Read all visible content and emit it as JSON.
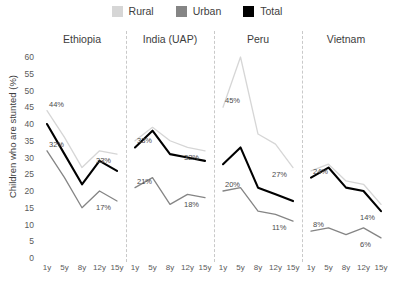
{
  "chart_data": {
    "type": "line",
    "title": "",
    "xlabel": "",
    "ylabel": "Children who are stunted (%)",
    "ylim": [
      0,
      60
    ],
    "yticks": [
      0,
      5,
      10,
      15,
      20,
      25,
      30,
      35,
      40,
      45,
      50,
      55,
      60
    ],
    "grid": false,
    "legend_position": "top-center",
    "legend": [
      {
        "name": "Rural",
        "color": "#d6d6d6"
      },
      {
        "name": "Urban",
        "color": "#858585"
      },
      {
        "name": "Total",
        "color": "#000000"
      }
    ],
    "categories": [
      "1y",
      "5y",
      "8y",
      "12y",
      "15y"
    ],
    "panels": [
      {
        "name": "Ethiopia",
        "series": [
          {
            "name": "Rural",
            "values": [
              44,
              36,
              27,
              32,
              31
            ]
          },
          {
            "name": "Total",
            "values": [
              40,
              31,
              22,
              29,
              26
            ]
          },
          {
            "name": "Urban",
            "values": [
              32,
              24,
              15,
              20,
              17
            ]
          }
        ],
        "annotations": [
          {
            "text": "44%",
            "series": "Rural",
            "index": 0
          },
          {
            "text": "32%",
            "series": "Urban",
            "index": 0
          },
          {
            "text": "33%",
            "series": "Rural",
            "index": 4
          },
          {
            "text": "17%",
            "series": "Urban",
            "index": 4
          }
        ]
      },
      {
        "name": "India (UAP)",
        "series": [
          {
            "name": "Rural",
            "values": [
              35,
              39,
              35,
              33,
              32
            ]
          },
          {
            "name": "Total",
            "values": [
              33,
              38,
              31,
              30,
              29
            ]
          },
          {
            "name": "Urban",
            "values": [
              21,
              24,
              16,
              19,
              18
            ]
          }
        ],
        "annotations": [
          {
            "text": "33%",
            "series": "Total",
            "index": 0
          },
          {
            "text": "21%",
            "series": "Urban",
            "index": 0
          },
          {
            "text": "32%",
            "series": "Rural",
            "index": 4
          },
          {
            "text": "18%",
            "series": "Urban",
            "index": 4
          }
        ]
      },
      {
        "name": "Peru",
        "series": [
          {
            "name": "Rural",
            "values": [
              45,
              60,
              37,
              34,
              27
            ]
          },
          {
            "name": "Total",
            "values": [
              28,
              33,
              21,
              19,
              17
            ]
          },
          {
            "name": "Urban",
            "values": [
              20,
              21,
              14,
              13,
              11
            ]
          }
        ],
        "annotations": [
          {
            "text": "45%",
            "series": "Rural",
            "index": 0
          },
          {
            "text": "20%",
            "series": "Urban",
            "index": 0
          },
          {
            "text": "27%",
            "series": "Rural",
            "index": 4
          },
          {
            "text": "11%",
            "series": "Urban",
            "index": 4
          }
        ]
      },
      {
        "name": "Vietnam",
        "series": [
          {
            "name": "Rural",
            "values": [
              26,
              28,
              23,
              22,
              16
            ]
          },
          {
            "name": "Total",
            "values": [
              24,
              27,
              21,
              20,
              14
            ]
          },
          {
            "name": "Urban",
            "values": [
              8,
              9,
              7,
              9,
              6
            ]
          }
        ],
        "annotations": [
          {
            "text": "24%",
            "series": "Total",
            "index": 0
          },
          {
            "text": "8%",
            "series": "Urban",
            "index": 0
          },
          {
            "text": "14%",
            "series": "Total",
            "index": 4
          },
          {
            "text": "6%",
            "series": "Urban",
            "index": 4
          }
        ]
      }
    ]
  }
}
